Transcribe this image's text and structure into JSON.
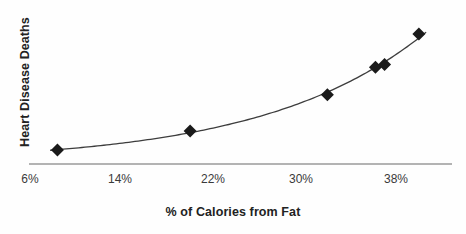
{
  "chart_data": {
    "type": "scatter",
    "title": "",
    "subtitle": "",
    "xlabel": "% of Calories from Fat",
    "ylabel": "Heart Disease Deaths",
    "xlim": [
      4,
      42
    ],
    "ylim": [
      0,
      100
    ],
    "grid": false,
    "legend": null,
    "legend_position": "none",
    "x_tick_labels": [
      "6%",
      "14%",
      "22%",
      "30%",
      "38%"
    ],
    "x_tick_values": [
      6,
      14,
      22,
      30,
      38
    ],
    "y_tick_labels": [],
    "marker_style": "diamond",
    "marker_color": "#1a1a1a",
    "curve_color": "#3d3d3d",
    "axis_color": "#b3b3b3",
    "background_color": "#fefefe",
    "fit_curve": {
      "type": "exponential",
      "described_as": "smooth increasing exponential trend line through the points"
    },
    "points": [
      {
        "x": 8.4,
        "y": 9
      },
      {
        "x": 20.0,
        "y": 22
      },
      {
        "x": 32.0,
        "y": 47
      },
      {
        "x": 36.2,
        "y": 66
      },
      {
        "x": 37.0,
        "y": 68
      },
      {
        "x": 40.0,
        "y": 89
      }
    ],
    "annotations": []
  },
  "axes": {
    "x_title": "% of Calories from Fat",
    "y_title": "Heart Disease Deaths",
    "ticks": [
      {
        "label": "6%",
        "px": 30
      },
      {
        "label": "14%",
        "px": 120
      },
      {
        "label": "22%",
        "px": 213
      },
      {
        "label": "30%",
        "px": 301
      },
      {
        "label": "38%",
        "px": 396
      }
    ]
  }
}
